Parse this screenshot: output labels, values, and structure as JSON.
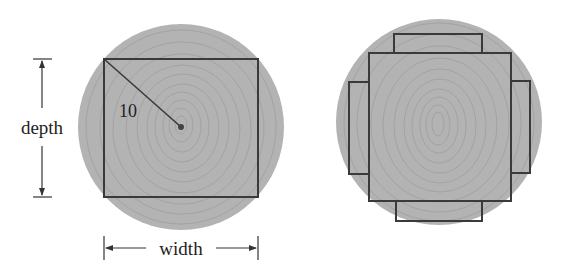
{
  "figure": {
    "left": {
      "title": "log cross-section with inscribed rectangular beam",
      "radius_label": "10",
      "depth_label": "depth",
      "width_label": "width"
    },
    "right": {
      "title": "log cross-section with central beam and four side slabs"
    },
    "colors": {
      "wood": "#b3b3b3",
      "grain": "#9e9e9e",
      "outline": "#3a3a3a",
      "dimension_line": "#333333",
      "background": "#ffffff"
    }
  }
}
